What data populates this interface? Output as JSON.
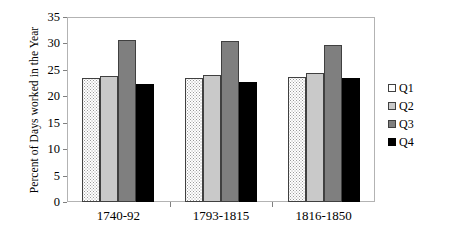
{
  "chart_data": {
    "type": "bar",
    "title": "",
    "xlabel": "",
    "ylabel": "Percent of Days worked in the Year",
    "categories": [
      "1740-92",
      "1793-1815",
      "1816-1850"
    ],
    "series": [
      {
        "name": "Q1",
        "values": [
          23.4,
          23.5,
          23.6
        ],
        "color": "#ffffff",
        "pattern": "stipple"
      },
      {
        "name": "Q2",
        "values": [
          23.8,
          24.0,
          24.5
        ],
        "color": "#c9c9c9",
        "pattern": "solid"
      },
      {
        "name": "Q3",
        "values": [
          30.6,
          30.5,
          29.7
        ],
        "color": "#7f7f7f",
        "pattern": "solid"
      },
      {
        "name": "Q4",
        "values": [
          22.3,
          22.7,
          23.4
        ],
        "color": "#000000",
        "pattern": "solid"
      }
    ],
    "ylim": [
      0,
      35
    ],
    "yticks": [
      0,
      5,
      10,
      15,
      20,
      25,
      30,
      35
    ],
    "ytick_labels": [
      "0",
      "5",
      "10",
      "15",
      "20",
      "25",
      "30",
      "35"
    ],
    "grid": false,
    "legend_position": "right",
    "legend_entries": [
      "Q1",
      "Q2",
      "Q3",
      "Q4"
    ]
  }
}
